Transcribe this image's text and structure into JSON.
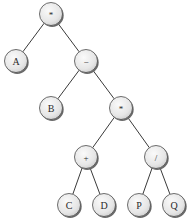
{
  "diagram": {
    "type": "expression-tree",
    "nodes": [
      {
        "id": "n1",
        "label": "*",
        "kind": "operator",
        "x": 51,
        "y": 14
      },
      {
        "id": "n2",
        "label": "A",
        "kind": "operand",
        "x": 16,
        "y": 61
      },
      {
        "id": "n3",
        "label": "−",
        "kind": "operator",
        "x": 86,
        "y": 61
      },
      {
        "id": "n4",
        "label": "B",
        "kind": "operand",
        "x": 51,
        "y": 108
      },
      {
        "id": "n5",
        "label": "*",
        "kind": "operator",
        "x": 121,
        "y": 108
      },
      {
        "id": "n6",
        "label": "+",
        "kind": "operator",
        "x": 86,
        "y": 157
      },
      {
        "id": "n7",
        "label": "/",
        "kind": "operator",
        "x": 156,
        "y": 157
      },
      {
        "id": "n8",
        "label": "C",
        "kind": "operand",
        "x": 69,
        "y": 205
      },
      {
        "id": "n9",
        "label": "D",
        "kind": "operand",
        "x": 104,
        "y": 205
      },
      {
        "id": "n10",
        "label": "P",
        "kind": "operand",
        "x": 139,
        "y": 205
      },
      {
        "id": "n11",
        "label": "Q",
        "kind": "operand",
        "x": 174,
        "y": 205
      }
    ],
    "edges": [
      {
        "from": "n1",
        "to": "n2"
      },
      {
        "from": "n1",
        "to": "n3"
      },
      {
        "from": "n3",
        "to": "n4"
      },
      {
        "from": "n3",
        "to": "n5"
      },
      {
        "from": "n5",
        "to": "n6"
      },
      {
        "from": "n5",
        "to": "n7"
      },
      {
        "from": "n6",
        "to": "n8"
      },
      {
        "from": "n6",
        "to": "n9"
      },
      {
        "from": "n7",
        "to": "n10"
      },
      {
        "from": "n7",
        "to": "n11"
      }
    ],
    "expression": "A * (B − ((C + D) * (P / Q)))",
    "node_radius": 11.5,
    "colors": {
      "node_fill_light": "#fafafa",
      "node_fill_dark": "#d4d4d4",
      "node_stroke": "#4a4a4a",
      "edge": "#3a3a3a",
      "label": "#2a2a2a",
      "background": "#ffffff"
    }
  }
}
